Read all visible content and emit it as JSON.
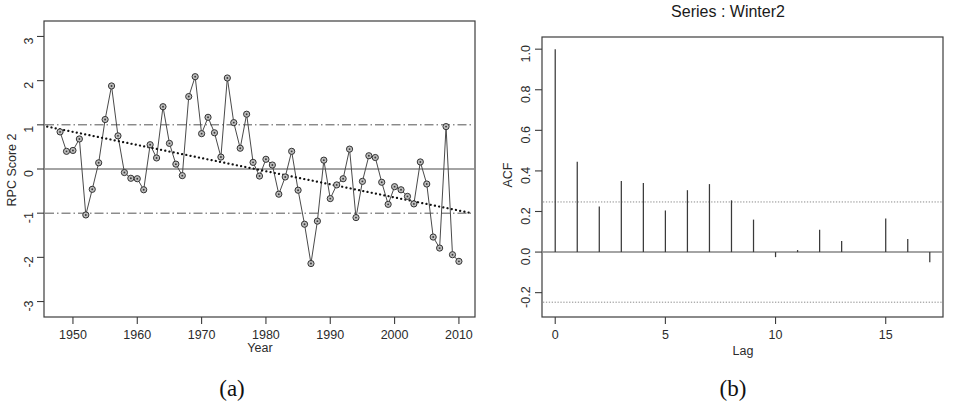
{
  "figure": {
    "caption_a": "(a)",
    "caption_b": "(b)"
  },
  "panel_a": {
    "caption": "(a)",
    "xlabel": "Year",
    "ylabel": "RPC Score 2"
  },
  "panel_b": {
    "caption": "(b)",
    "title": "Series : Winter2",
    "xlabel": "Lag",
    "ylabel": "ACF"
  },
  "chart_data": [
    {
      "type": "line",
      "id": "rpc-score-2-timeseries",
      "title": "",
      "xlabel": "Year",
      "ylabel": "RPC Score 2",
      "xlim": [
        1945.5,
        2012.5
      ],
      "ylim": [
        -3.35,
        3.35
      ],
      "xticks": [
        1950,
        1960,
        1970,
        1980,
        1990,
        2000,
        2010
      ],
      "yticks": [
        3,
        2,
        1,
        0,
        -1,
        -2,
        -3
      ],
      "grid": false,
      "legend": "none",
      "markers": "open-circle-with-dot",
      "annotations": [
        {
          "name": "upper-confidence-line",
          "type": "hline",
          "y": 1,
          "style": "dot-dash"
        },
        {
          "name": "zero-line",
          "type": "hline",
          "y": 0,
          "style": "solid"
        },
        {
          "name": "lower-confidence-line",
          "type": "hline",
          "y": -1,
          "style": "dot-dash"
        },
        {
          "name": "trend-line",
          "type": "line",
          "style": "dotted",
          "from": [
            1946.0,
            0.96
          ],
          "to": [
            2012.0,
            -1.0
          ]
        }
      ],
      "x": [
        1948,
        1949,
        1950,
        1951,
        1952,
        1953,
        1954,
        1955,
        1956,
        1957,
        1958,
        1959,
        1960,
        1961,
        1962,
        1963,
        1964,
        1965,
        1966,
        1967,
        1968,
        1969,
        1970,
        1971,
        1972,
        1973,
        1974,
        1975,
        1976,
        1977,
        1978,
        1979,
        1980,
        1981,
        1982,
        1983,
        1984,
        1985,
        1986,
        1987,
        1988,
        1989,
        1990,
        1991,
        1992,
        1993,
        1994,
        1995,
        1996,
        1997,
        1998,
        1999,
        2000,
        2001,
        2002,
        2003,
        2004,
        2005,
        2006,
        2007,
        2008,
        2009,
        2010
      ],
      "y": [
        0.84,
        0.4,
        0.42,
        0.68,
        -1.04,
        -0.46,
        0.14,
        1.12,
        1.88,
        0.75,
        -0.08,
        -0.21,
        -0.22,
        -0.47,
        0.55,
        0.25,
        1.41,
        0.58,
        0.11,
        -0.15,
        1.64,
        2.09,
        0.8,
        1.17,
        0.82,
        0.27,
        2.06,
        1.05,
        0.47,
        1.24,
        0.15,
        -0.16,
        0.22,
        0.09,
        -0.57,
        -0.18,
        0.4,
        -0.48,
        -1.25,
        -2.14,
        -1.18,
        0.2,
        -0.67,
        -0.36,
        -0.22,
        0.45,
        -1.1,
        -0.28,
        0.3,
        0.26,
        -0.3,
        -0.8,
        -0.4,
        -0.47,
        -0.62,
        -0.79,
        0.16,
        -0.34,
        -1.54,
        -1.79,
        0.96,
        -1.94,
        -2.09
      ]
    },
    {
      "type": "bar",
      "id": "acf-winter2",
      "title": "Series : Winter2",
      "xlabel": "Lag",
      "ylabel": "ACF",
      "xlim": [
        -0.6,
        17.6
      ],
      "ylim": [
        -0.32,
        1.06
      ],
      "xticks": [
        0,
        5,
        10,
        15
      ],
      "yticks": [
        1.0,
        0.8,
        0.6,
        0.4,
        0.2,
        0.0,
        -0.2
      ],
      "grid": false,
      "legend": "none",
      "confidence_bands": [
        0.247,
        -0.247
      ],
      "categories": [
        0,
        1,
        2,
        3,
        4,
        5,
        6,
        7,
        8,
        9,
        10,
        11,
        12,
        13,
        14,
        15,
        16,
        17
      ],
      "values": [
        1.0,
        0.445,
        0.225,
        0.35,
        0.34,
        0.205,
        0.305,
        0.335,
        0.255,
        0.16,
        -0.025,
        0.01,
        0.11,
        0.055,
        0.0,
        0.165,
        0.065,
        -0.05
      ]
    }
  ]
}
